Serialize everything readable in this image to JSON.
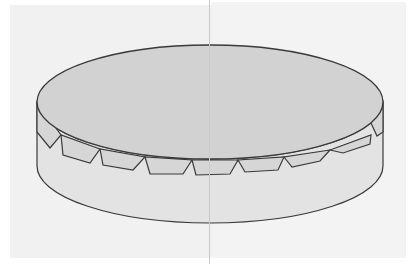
{
  "figure": {
    "colors": {
      "background": "#ffffff",
      "paper": "#f1f1f1",
      "top_face": "#d2d2d2",
      "side_face": "#e3e3e3",
      "flap_fill": "#d6d6d6",
      "outline": "#3a3a3a",
      "fold_line": "#c9c9c9"
    },
    "cylinder": {
      "top_ellipse": {
        "cx": 210,
        "cy": 102,
        "rx": 173,
        "ry": 57
      },
      "bottom_ellipse": {
        "cx": 210,
        "cy": 166,
        "rx": 173,
        "ry": 57
      }
    },
    "flap_count": 9
  }
}
